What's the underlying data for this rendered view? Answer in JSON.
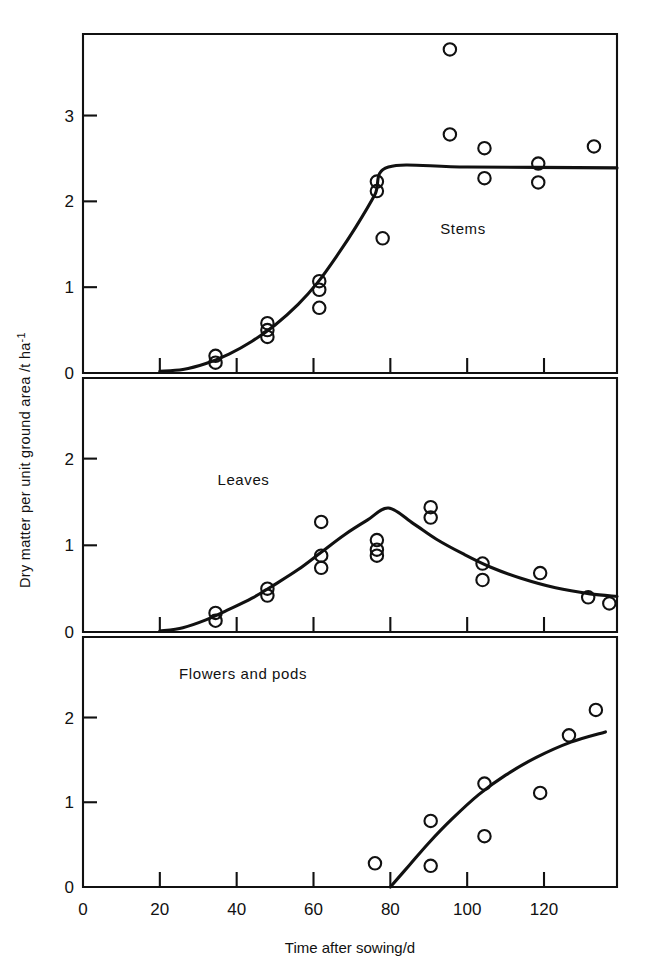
{
  "figure": {
    "xlabel": "Time after sowing/d",
    "ylabel_main": "Dry matter per unit ground area /t ha",
    "ylabel_sup": "-1",
    "x_ticks": [
      0,
      20,
      40,
      60,
      80,
      100,
      120
    ],
    "x_tick_labels": [
      "0",
      "20",
      "40",
      "60",
      "80",
      "100",
      "120"
    ],
    "xlim": [
      0,
      139
    ]
  },
  "chart_data": {
    "type": "scatter",
    "title": "",
    "xlabel": "Time after sowing/d",
    "ylabel": "Dry matter per unit ground area /t ha^-1",
    "xlim": [
      0,
      139
    ],
    "grid": false,
    "legend": "none",
    "panels": [
      {
        "name": "Stems",
        "label": "Stems",
        "label_x": 93,
        "label_y": 1.62,
        "ylim": [
          0,
          3.95
        ],
        "y_ticks": [
          0,
          1,
          2,
          3
        ],
        "y_tick_labels": [
          "0",
          "1",
          "2",
          "3"
        ],
        "points": [
          {
            "x": 34.5,
            "y": 0.2
          },
          {
            "x": 34.5,
            "y": 0.12
          },
          {
            "x": 48.0,
            "y": 0.58
          },
          {
            "x": 48.0,
            "y": 0.5
          },
          {
            "x": 48.0,
            "y": 0.42
          },
          {
            "x": 61.5,
            "y": 1.07
          },
          {
            "x": 61.5,
            "y": 0.97
          },
          {
            "x": 61.5,
            "y": 0.76
          },
          {
            "x": 76.5,
            "y": 2.23
          },
          {
            "x": 76.5,
            "y": 2.12
          },
          {
            "x": 78.0,
            "y": 1.57
          },
          {
            "x": 95.5,
            "y": 3.77
          },
          {
            "x": 95.5,
            "y": 2.78
          },
          {
            "x": 104.5,
            "y": 2.62
          },
          {
            "x": 104.5,
            "y": 2.27
          },
          {
            "x": 118.5,
            "y": 2.44
          },
          {
            "x": 118.5,
            "y": 2.22
          },
          {
            "x": 133.0,
            "y": 2.64
          }
        ],
        "curve": [
          {
            "x": 20.0,
            "y": 0.02
          },
          {
            "x": 26.0,
            "y": 0.04
          },
          {
            "x": 32.0,
            "y": 0.11
          },
          {
            "x": 38.0,
            "y": 0.22
          },
          {
            "x": 44.0,
            "y": 0.37
          },
          {
            "x": 50.0,
            "y": 0.56
          },
          {
            "x": 56.0,
            "y": 0.8
          },
          {
            "x": 61.0,
            "y": 1.05
          },
          {
            "x": 66.0,
            "y": 1.36
          },
          {
            "x": 71.0,
            "y": 1.7
          },
          {
            "x": 76.0,
            "y": 2.08
          },
          {
            "x": 79.5,
            "y": 2.4
          },
          {
            "x": 100.0,
            "y": 2.4
          },
          {
            "x": 139.0,
            "y": 2.39
          }
        ]
      },
      {
        "name": "Leaves",
        "label": "Leaves",
        "label_x": 35,
        "label_y": 1.7,
        "ylim": [
          0,
          2.93
        ],
        "y_ticks": [
          0,
          1,
          2
        ],
        "y_tick_labels": [
          "0",
          "1",
          "2"
        ],
        "points": [
          {
            "x": 34.5,
            "y": 0.22
          },
          {
            "x": 34.5,
            "y": 0.13
          },
          {
            "x": 48.0,
            "y": 0.5
          },
          {
            "x": 48.0,
            "y": 0.42
          },
          {
            "x": 62.0,
            "y": 1.27
          },
          {
            "x": 62.0,
            "y": 0.88
          },
          {
            "x": 62.0,
            "y": 0.74
          },
          {
            "x": 76.5,
            "y": 1.06
          },
          {
            "x": 76.5,
            "y": 0.95
          },
          {
            "x": 76.5,
            "y": 0.88
          },
          {
            "x": 90.5,
            "y": 1.44
          },
          {
            "x": 90.5,
            "y": 1.32
          },
          {
            "x": 104.0,
            "y": 0.79
          },
          {
            "x": 104.0,
            "y": 0.6
          },
          {
            "x": 119.0,
            "y": 0.68
          },
          {
            "x": 131.5,
            "y": 0.4
          },
          {
            "x": 137.0,
            "y": 0.33
          }
        ],
        "curve": [
          {
            "x": 20.0,
            "y": 0.01
          },
          {
            "x": 26.0,
            "y": 0.05
          },
          {
            "x": 32.0,
            "y": 0.14
          },
          {
            "x": 38.0,
            "y": 0.26
          },
          {
            "x": 44.0,
            "y": 0.39
          },
          {
            "x": 50.0,
            "y": 0.55
          },
          {
            "x": 56.0,
            "y": 0.72
          },
          {
            "x": 62.0,
            "y": 0.92
          },
          {
            "x": 68.0,
            "y": 1.12
          },
          {
            "x": 74.0,
            "y": 1.29
          },
          {
            "x": 79.5,
            "y": 1.43
          },
          {
            "x": 86.0,
            "y": 1.25
          },
          {
            "x": 92.0,
            "y": 1.07
          },
          {
            "x": 99.0,
            "y": 0.9
          },
          {
            "x": 106.0,
            "y": 0.75
          },
          {
            "x": 114.0,
            "y": 0.62
          },
          {
            "x": 123.0,
            "y": 0.51
          },
          {
            "x": 132.0,
            "y": 0.44
          },
          {
            "x": 139.0,
            "y": 0.41
          }
        ]
      },
      {
        "name": "Flowers and pods",
        "label": "Flowers and pods",
        "label_x": 25,
        "label_y": 2.45,
        "ylim": [
          0,
          2.95
        ],
        "y_ticks": [
          0,
          1,
          2
        ],
        "y_tick_labels": [
          "0",
          "1",
          "2"
        ],
        "points": [
          {
            "x": 76.0,
            "y": 0.28
          },
          {
            "x": 90.5,
            "y": 0.78
          },
          {
            "x": 90.5,
            "y": 0.25
          },
          {
            "x": 104.5,
            "y": 1.22
          },
          {
            "x": 104.5,
            "y": 0.6
          },
          {
            "x": 119.0,
            "y": 1.11
          },
          {
            "x": 126.5,
            "y": 1.79
          },
          {
            "x": 133.5,
            "y": 2.09
          }
        ],
        "curve": [
          {
            "x": 80.0,
            "y": 0.0
          },
          {
            "x": 85.0,
            "y": 0.26
          },
          {
            "x": 90.0,
            "y": 0.52
          },
          {
            "x": 96.0,
            "y": 0.8
          },
          {
            "x": 103.0,
            "y": 1.09
          },
          {
            "x": 110.0,
            "y": 1.32
          },
          {
            "x": 118.0,
            "y": 1.53
          },
          {
            "x": 127.0,
            "y": 1.71
          },
          {
            "x": 136.0,
            "y": 1.83
          }
        ]
      }
    ]
  }
}
